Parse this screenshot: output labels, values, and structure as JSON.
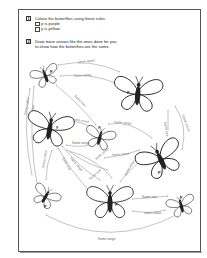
{
  "instructions": [
    {
      "number": "1",
      "lines": [
        "Colour the butterflies using these rules:"
      ],
      "rules": [
        "p is purple",
        "y is yellow."
      ]
    },
    {
      "number": "2",
      "lines": [
        "Draw more arrows like the ones done for you",
        "to show how the butterflies are the same."
      ]
    }
  ],
  "butterflies": [
    {
      "id": "b1",
      "letter": "p",
      "size": "small"
    },
    {
      "id": "b2",
      "letter": "p",
      "size": "large"
    },
    {
      "id": "b3",
      "letter": "y",
      "size": "large"
    },
    {
      "id": "b4",
      "letter": "y",
      "size": "small"
    },
    {
      "id": "b5",
      "letter": "p",
      "size": "large"
    },
    {
      "id": "b6",
      "letter": "p",
      "size": "small"
    },
    {
      "id": "b7",
      "letter": "p",
      "size": "large"
    },
    {
      "id": "b8",
      "letter": "y",
      "size": "small"
    }
  ],
  "arrow_labels": {
    "a1": "same colour",
    "a2": "Same wings",
    "a3": "Same size",
    "a4": "Same colour",
    "a5": "Same size",
    "a6": "same colour",
    "a7": "Same wings",
    "a8": "Same size",
    "a9": "Same colour",
    "a10": "Same wings",
    "a11": "Same colour",
    "a12": "Same size",
    "a13": "Same wings",
    "a14": "same colour",
    "a15": "Same size",
    "a16": "Same colour",
    "a17": "Same wings",
    "a18": "Same size",
    "a19": "same colour",
    "a20": "Same wings",
    "a21": "Same size"
  },
  "colors": {
    "border": "#555555",
    "ink": "#111111",
    "arrow": "#888888"
  }
}
